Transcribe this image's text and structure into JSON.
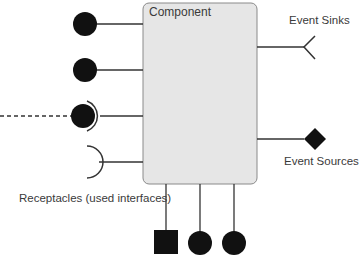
{
  "diagram": {
    "component": {
      "title": "Component",
      "fill": "#e6e6e6",
      "stroke": "#8a8a8a"
    },
    "labels": {
      "event_sinks": "Event Sinks",
      "event_sources": "Event Sources",
      "receptacles": "Receptacles (used interfaces)"
    },
    "ports": {
      "facets_left": [
        {
          "type": "facet-circle",
          "y": 24
        },
        {
          "type": "facet-circle",
          "y": 70
        },
        {
          "type": "facet-circle-connected",
          "y": 116,
          "connection": "dashed"
        }
      ],
      "receptacles_left": [
        {
          "type": "receptacle-arc",
          "y": 162
        }
      ],
      "event_sinks_right": [
        {
          "type": "chevron",
          "y": 47
        }
      ],
      "event_sources_right": [
        {
          "type": "diamond",
          "y": 139
        }
      ],
      "bottom": [
        {
          "type": "square",
          "x": 166
        },
        {
          "type": "circle",
          "x": 200
        },
        {
          "type": "circle",
          "x": 234
        }
      ]
    },
    "colors": {
      "line": "#333333",
      "shape_fill": "#111111"
    }
  }
}
